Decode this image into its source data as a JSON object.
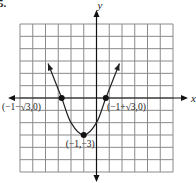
{
  "problem_number": "5.",
  "chart_data": {
    "type": "line",
    "title": "",
    "function": "y = (x + 1)^2 - 3",
    "xlabel": "x",
    "ylabel": "y",
    "xlim": [
      -6,
      6
    ],
    "ylim": [
      -6,
      6
    ],
    "grid": true,
    "grid_step": 1,
    "series": [
      {
        "name": "parabola",
        "x": [
          -3.8,
          -2.732,
          -2,
          -1,
          0,
          0.732,
          1.8
        ],
        "y": [
          2.8,
          0,
          -2,
          -3,
          -2,
          0,
          2.8
        ]
      }
    ],
    "points": [
      {
        "label": "(−1−√3,0)",
        "x": -2.732,
        "y": 0
      },
      {
        "label": "(−1+√3,0)",
        "x": 0.732,
        "y": 0
      },
      {
        "label": "(−1,−3)",
        "x": -1,
        "y": -3
      }
    ],
    "annotations": [
      "(−1−√3,0)",
      "(−1+√3,0)",
      "(−1,−3)"
    ]
  },
  "colors": {
    "grid": "#8a8a8a",
    "axis": "#111111",
    "curve": "#222222"
  }
}
